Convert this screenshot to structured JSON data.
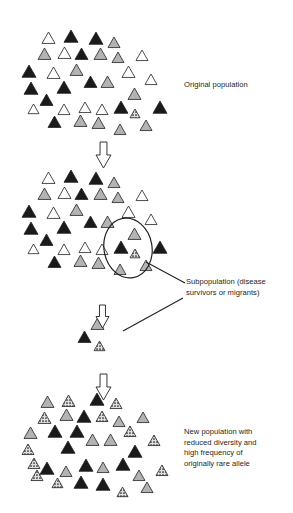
{
  "figure": {
    "title_visible": false,
    "background_color": "#ffffff",
    "line_color": "#231f20",
    "captions": {
      "original": "Original population",
      "subpopulation": "Subpopulation (disease\nsurvivors or migrants)",
      "new_population": "New population with\nreduced diversity and\nhigh frequency of\noriginally rare allele"
    },
    "legend_fills": {
      "white": "#ffffff",
      "gray": "#b3b3b3",
      "black": "#1a1a1a",
      "speckled": "#d9d9d9",
      "outline": "#231f20"
    },
    "arrows": [
      {
        "name": "arrow-original-to-middle",
        "x": 96,
        "y": 142,
        "w": 15,
        "h": 26
      },
      {
        "name": "arrow-middle-to-subpop",
        "x": 96,
        "y": 305,
        "w": 13,
        "h": 23
      },
      {
        "name": "arrow-subpop-to-new",
        "x": 96,
        "y": 374,
        "w": 15,
        "h": 26
      }
    ],
    "ellipse": {
      "name": "subpopulation-highlight-ellipse",
      "cx": 128,
      "cy": 248,
      "rx": 24,
      "ry": 30,
      "rotation": -10
    },
    "leader_lines": [
      {
        "name": "leader-line-ellipse",
        "x1": 146,
        "y1": 262,
        "x2": 185,
        "y2": 283
      },
      {
        "name": "leader-line-subpop-cluster",
        "x1": 123,
        "y1": 331,
        "x2": 183,
        "y2": 298
      }
    ],
    "populations": [
      {
        "name": "original-population",
        "label": "Original population",
        "counts": {
          "white": 14,
          "gray": 14,
          "black": 13,
          "speckled": 1
        },
        "triangles": [
          {
            "x": 42,
            "y": 32,
            "s": 13,
            "fill": "white"
          },
          {
            "x": 64,
            "y": 30,
            "s": 14,
            "fill": "black"
          },
          {
            "x": 89,
            "y": 32,
            "s": 14,
            "fill": "black"
          },
          {
            "x": 108,
            "y": 37,
            "s": 12,
            "fill": "gray"
          },
          {
            "x": 38,
            "y": 48,
            "s": 13,
            "fill": "gray"
          },
          {
            "x": 58,
            "y": 47,
            "s": 13,
            "fill": "white"
          },
          {
            "x": 75,
            "y": 48,
            "s": 13,
            "fill": "black"
          },
          {
            "x": 94,
            "y": 48,
            "s": 13,
            "fill": "gray"
          },
          {
            "x": 112,
            "y": 52,
            "s": 12,
            "fill": "gray"
          },
          {
            "x": 136,
            "y": 50,
            "s": 12,
            "fill": "white"
          },
          {
            "x": 22,
            "y": 65,
            "s": 14,
            "fill": "black"
          },
          {
            "x": 47,
            "y": 67,
            "s": 13,
            "fill": "white"
          },
          {
            "x": 70,
            "y": 64,
            "s": 13,
            "fill": "gray"
          },
          {
            "x": 122,
            "y": 66,
            "s": 13,
            "fill": "white"
          },
          {
            "x": 24,
            "y": 82,
            "s": 14,
            "fill": "black"
          },
          {
            "x": 57,
            "y": 81,
            "s": 14,
            "fill": "black"
          },
          {
            "x": 84,
            "y": 76,
            "s": 13,
            "fill": "black"
          },
          {
            "x": 101,
            "y": 76,
            "s": 13,
            "fill": "gray"
          },
          {
            "x": 145,
            "y": 74,
            "s": 12,
            "fill": "white"
          },
          {
            "x": 40,
            "y": 94,
            "s": 13,
            "fill": "black"
          },
          {
            "x": 128,
            "y": 88,
            "s": 13,
            "fill": "gray"
          },
          {
            "x": 28,
            "y": 104,
            "s": 11,
            "fill": "white"
          },
          {
            "x": 58,
            "y": 104,
            "s": 12,
            "fill": "white"
          },
          {
            "x": 79,
            "y": 102,
            "s": 12,
            "fill": "white"
          },
          {
            "x": 96,
            "y": 104,
            "s": 12,
            "fill": "white"
          },
          {
            "x": 114,
            "y": 101,
            "s": 14,
            "fill": "black"
          },
          {
            "x": 153,
            "y": 101,
            "s": 14,
            "fill": "black"
          },
          {
            "x": 130,
            "y": 109,
            "s": 10,
            "fill": "speckled"
          },
          {
            "x": 48,
            "y": 116,
            "s": 13,
            "fill": "black"
          },
          {
            "x": 74,
            "y": 115,
            "s": 13,
            "fill": "gray"
          },
          {
            "x": 92,
            "y": 117,
            "s": 13,
            "fill": "gray"
          },
          {
            "x": 114,
            "y": 124,
            "s": 12,
            "fill": "gray"
          },
          {
            "x": 140,
            "y": 120,
            "s": 12,
            "fill": "gray"
          }
        ]
      },
      {
        "name": "middle-population",
        "label": "",
        "counts": {
          "white": 14,
          "gray": 15,
          "black": 13,
          "speckled": 1
        },
        "triangles": [
          {
            "x": 42,
            "y": 172,
            "s": 13,
            "fill": "white"
          },
          {
            "x": 64,
            "y": 170,
            "s": 14,
            "fill": "black"
          },
          {
            "x": 89,
            "y": 172,
            "s": 14,
            "fill": "black"
          },
          {
            "x": 108,
            "y": 177,
            "s": 12,
            "fill": "gray"
          },
          {
            "x": 38,
            "y": 188,
            "s": 13,
            "fill": "gray"
          },
          {
            "x": 58,
            "y": 187,
            "s": 13,
            "fill": "white"
          },
          {
            "x": 75,
            "y": 188,
            "s": 13,
            "fill": "black"
          },
          {
            "x": 94,
            "y": 188,
            "s": 13,
            "fill": "gray"
          },
          {
            "x": 112,
            "y": 192,
            "s": 12,
            "fill": "gray"
          },
          {
            "x": 136,
            "y": 190,
            "s": 12,
            "fill": "white"
          },
          {
            "x": 22,
            "y": 205,
            "s": 14,
            "fill": "black"
          },
          {
            "x": 47,
            "y": 207,
            "s": 13,
            "fill": "white"
          },
          {
            "x": 70,
            "y": 204,
            "s": 13,
            "fill": "gray"
          },
          {
            "x": 122,
            "y": 206,
            "s": 13,
            "fill": "white"
          },
          {
            "x": 24,
            "y": 222,
            "s": 14,
            "fill": "black"
          },
          {
            "x": 57,
            "y": 221,
            "s": 14,
            "fill": "black"
          },
          {
            "x": 84,
            "y": 216,
            "s": 13,
            "fill": "black"
          },
          {
            "x": 101,
            "y": 216,
            "s": 13,
            "fill": "gray"
          },
          {
            "x": 145,
            "y": 214,
            "s": 12,
            "fill": "white"
          },
          {
            "x": 40,
            "y": 234,
            "s": 13,
            "fill": "black"
          },
          {
            "x": 128,
            "y": 228,
            "s": 13,
            "fill": "gray"
          },
          {
            "x": 28,
            "y": 244,
            "s": 11,
            "fill": "white"
          },
          {
            "x": 58,
            "y": 244,
            "s": 12,
            "fill": "white"
          },
          {
            "x": 79,
            "y": 242,
            "s": 12,
            "fill": "white"
          },
          {
            "x": 96,
            "y": 244,
            "s": 12,
            "fill": "white"
          },
          {
            "x": 114,
            "y": 241,
            "s": 14,
            "fill": "black"
          },
          {
            "x": 153,
            "y": 241,
            "s": 14,
            "fill": "black"
          },
          {
            "x": 130,
            "y": 249,
            "s": 10,
            "fill": "speckled"
          },
          {
            "x": 48,
            "y": 256,
            "s": 13,
            "fill": "black"
          },
          {
            "x": 74,
            "y": 255,
            "s": 13,
            "fill": "gray"
          },
          {
            "x": 92,
            "y": 257,
            "s": 13,
            "fill": "gray"
          },
          {
            "x": 114,
            "y": 264,
            "s": 12,
            "fill": "gray"
          },
          {
            "x": 140,
            "y": 260,
            "s": 12,
            "fill": "gray"
          }
        ]
      },
      {
        "name": "subpopulation-cluster",
        "label": "Subpopulation (disease survivors or migrants)",
        "counts": {
          "white": 0,
          "gray": 1,
          "black": 1,
          "speckled": 1
        },
        "triangles": [
          {
            "x": 91,
            "y": 318,
            "s": 13,
            "fill": "gray"
          },
          {
            "x": 78,
            "y": 331,
            "s": 13,
            "fill": "black"
          },
          {
            "x": 94,
            "y": 341,
            "s": 11,
            "fill": "speckled"
          }
        ]
      },
      {
        "name": "new-population",
        "label": "New population with reduced diversity and high frequency of originally rare allele",
        "counts": {
          "white": 0,
          "gray": 14,
          "black": 15,
          "speckled": 15
        },
        "triangles": [
          {
            "x": 41,
            "y": 396,
            "s": 13,
            "fill": "gray"
          },
          {
            "x": 62,
            "y": 395,
            "s": 13,
            "fill": "speckled"
          },
          {
            "x": 90,
            "y": 393,
            "s": 14,
            "fill": "black"
          },
          {
            "x": 110,
            "y": 398,
            "s": 12,
            "fill": "speckled"
          },
          {
            "x": 38,
            "y": 412,
            "s": 13,
            "fill": "speckled"
          },
          {
            "x": 60,
            "y": 409,
            "s": 13,
            "fill": "gray"
          },
          {
            "x": 77,
            "y": 410,
            "s": 14,
            "fill": "black"
          },
          {
            "x": 96,
            "y": 411,
            "s": 12,
            "fill": "speckled"
          },
          {
            "x": 113,
            "y": 416,
            "s": 12,
            "fill": "gray"
          },
          {
            "x": 137,
            "y": 412,
            "s": 12,
            "fill": "gray"
          },
          {
            "x": 24,
            "y": 427,
            "s": 13,
            "fill": "gray"
          },
          {
            "x": 48,
            "y": 425,
            "s": 14,
            "fill": "black"
          },
          {
            "x": 70,
            "y": 425,
            "s": 14,
            "fill": "black"
          },
          {
            "x": 124,
            "y": 426,
            "s": 12,
            "fill": "speckled"
          },
          {
            "x": 86,
            "y": 434,
            "s": 13,
            "fill": "gray"
          },
          {
            "x": 104,
            "y": 434,
            "s": 13,
            "fill": "gray"
          },
          {
            "x": 148,
            "y": 435,
            "s": 12,
            "fill": "speckled"
          },
          {
            "x": 22,
            "y": 444,
            "s": 12,
            "fill": "speckled"
          },
          {
            "x": 61,
            "y": 441,
            "s": 14,
            "fill": "black"
          },
          {
            "x": 128,
            "y": 445,
            "s": 14,
            "fill": "black"
          },
          {
            "x": 28,
            "y": 458,
            "s": 12,
            "fill": "speckled"
          },
          {
            "x": 40,
            "y": 462,
            "s": 14,
            "fill": "black"
          },
          {
            "x": 79,
            "y": 459,
            "s": 14,
            "fill": "black"
          },
          {
            "x": 116,
            "y": 458,
            "s": 14,
            "fill": "black"
          },
          {
            "x": 97,
            "y": 462,
            "s": 12,
            "fill": "gray"
          },
          {
            "x": 60,
            "y": 466,
            "s": 12,
            "fill": "gray"
          },
          {
            "x": 31,
            "y": 470,
            "s": 12,
            "fill": "speckled"
          },
          {
            "x": 133,
            "y": 470,
            "s": 12,
            "fill": "gray"
          },
          {
            "x": 156,
            "y": 465,
            "s": 12,
            "fill": "speckled"
          },
          {
            "x": 52,
            "y": 478,
            "s": 11,
            "fill": "speckled"
          },
          {
            "x": 74,
            "y": 476,
            "s": 14,
            "fill": "black"
          },
          {
            "x": 96,
            "y": 478,
            "s": 14,
            "fill": "black"
          },
          {
            "x": 117,
            "y": 487,
            "s": 11,
            "fill": "speckled"
          },
          {
            "x": 141,
            "y": 482,
            "s": 12,
            "fill": "gray"
          }
        ]
      }
    ]
  }
}
